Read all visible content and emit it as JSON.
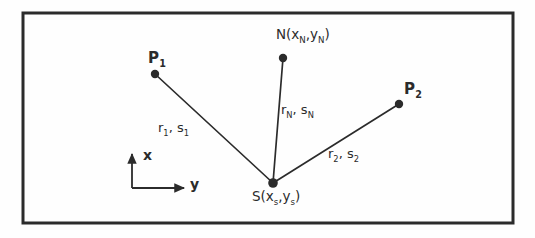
{
  "figure": {
    "kind": "geometry-diagram",
    "background_color": "#fefefe",
    "ink_color": "#2b2b2b",
    "frame": {
      "x": 23,
      "y": 13,
      "width": 490,
      "height": 210,
      "stroke_width": 3
    },
    "points": [
      {
        "id": "P1",
        "label": "P",
        "subscript": "1",
        "cx": 155,
        "cy": 74,
        "r": 4.2
      },
      {
        "id": "N",
        "label": "N",
        "subscript": "",
        "cx": 283,
        "cy": 58,
        "r": 4.2
      },
      {
        "id": "P2",
        "label": "P",
        "subscript": "2",
        "cx": 399,
        "cy": 104,
        "r": 4.2
      },
      {
        "id": "S",
        "label": "S",
        "subscript": "",
        "cx": 273,
        "cy": 183,
        "r": 4.6
      }
    ],
    "segments": [
      {
        "id": "P1-S",
        "from": "P1",
        "to": "S",
        "x1": 155,
        "y1": 74,
        "x2": 273,
        "y2": 183
      },
      {
        "id": "N-S",
        "from": "N",
        "to": "S",
        "x1": 283,
        "y1": 58,
        "x2": 273,
        "y2": 183
      },
      {
        "id": "P2-S",
        "from": "P2",
        "to": "S",
        "x1": 399,
        "y1": 104,
        "x2": 273,
        "y2": 183
      }
    ],
    "axes": {
      "origin_x": 132,
      "origin_y": 188,
      "vertical_tip_y": 152,
      "horizontal_tip_x": 186,
      "x_axis_label": "x",
      "y_axis_label": "y"
    }
  },
  "labels": {
    "p1": {
      "text": "P",
      "sub": "1"
    },
    "p2": {
      "text": "P",
      "sub": "2"
    },
    "n_point": {
      "text": "N(x",
      "sub1": "N",
      "mid": ",y",
      "sub2": "N",
      "close": ")"
    },
    "s_point": {
      "text": "S(x",
      "sub1": "s",
      "mid": ",y",
      "sub2": "s",
      "close": ")"
    },
    "edge_p1": {
      "r": "r",
      "rsub": "1",
      "comma": ", ",
      "s": "s",
      "ssub": "1"
    },
    "edge_n": {
      "r": "r",
      "rsub": "N",
      "comma": ", ",
      "s": "s",
      "ssub": "N"
    },
    "edge_p2": {
      "r": "r",
      "rsub": "2",
      "comma": ", ",
      "s": "s",
      "ssub": "2"
    },
    "axis_x": "x",
    "axis_y": "y"
  }
}
